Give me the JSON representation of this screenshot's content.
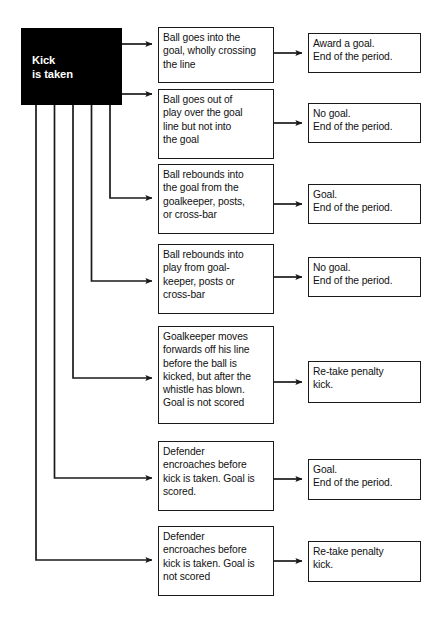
{
  "diagram": {
    "background_color": "#ffffff",
    "line_color": "#1a1a1a",
    "start_fill": "#000000",
    "start_text_color": "#ffffff"
  },
  "start_node": {
    "label": "Kick\nis taken",
    "x": 21,
    "y": 28,
    "w": 101,
    "h": 77
  },
  "conditions": [
    {
      "id": "c1",
      "label": "Ball goes into the\ngoal, wholly crossing\nthe line",
      "x": 158,
      "y": 27,
      "w": 116,
      "h": 56
    },
    {
      "id": "c2",
      "label": "Ball goes out of\nplay over the goal\nline but not into\nthe goal",
      "x": 158,
      "y": 89,
      "w": 116,
      "h": 70
    },
    {
      "id": "c3",
      "label": "Ball rebounds into\nthe goal from the\ngoalkeeper, posts,\nor cross-bar",
      "x": 158,
      "y": 164,
      "w": 116,
      "h": 70
    },
    {
      "id": "c4",
      "label": "Ball rebounds into\nplay from goal-\nkeeper, posts or\ncross-bar",
      "x": 158,
      "y": 244,
      "w": 116,
      "h": 70
    },
    {
      "id": "c5",
      "label": "Goalkeeper moves\nforwards off his line\nbefore the ball is\nkicked, but after the\nwhistle has blown.\nGoal is not scored",
      "x": 158,
      "y": 326,
      "w": 116,
      "h": 98
    },
    {
      "id": "c6",
      "label": "Defender\nencroaches before\nkick is taken. Goal is\nscored.",
      "x": 158,
      "y": 441,
      "w": 116,
      "h": 70
    },
    {
      "id": "c7",
      "label": "Defender\nencroaches before\nkick is taken. Goal is\nnot scored",
      "x": 158,
      "y": 526,
      "w": 116,
      "h": 70
    }
  ],
  "outcomes": [
    {
      "id": "o1",
      "label": "Award a goal.\nEnd of the period.",
      "x": 308,
      "y": 33,
      "w": 113,
      "h": 40
    },
    {
      "id": "o2",
      "label": "No goal.\nEnd of the period.",
      "x": 308,
      "y": 103,
      "w": 113,
      "h": 40
    },
    {
      "id": "o3",
      "label": "Goal.\nEnd of the period.",
      "x": 308,
      "y": 184,
      "w": 113,
      "h": 40
    },
    {
      "id": "o4",
      "label": "No goal.\nEnd of the period.",
      "x": 308,
      "y": 257,
      "w": 113,
      "h": 40
    },
    {
      "id": "o5",
      "label": "Re-take penalty\nkick.",
      "x": 308,
      "y": 361,
      "w": 113,
      "h": 42
    },
    {
      "id": "o6",
      "label": "Goal.\nEnd of the period.",
      "x": 308,
      "y": 459,
      "w": 113,
      "h": 41
    },
    {
      "id": "o7",
      "label": "Re-take penalty\nkick.",
      "x": 308,
      "y": 541,
      "w": 113,
      "h": 41
    }
  ],
  "edges": [
    {
      "from": "start",
      "to": "c1",
      "kind": "direct",
      "path": "M122,44 L152,44"
    },
    {
      "from": "start",
      "to": "c2",
      "kind": "direct",
      "path": "M122,94 L152,94"
    },
    {
      "from": "start",
      "to": "c3",
      "kind": "elbow",
      "path": "M110,105 L110,198 L152,198"
    },
    {
      "from": "start",
      "to": "c4",
      "kind": "elbow",
      "path": "M91.5,105 L91.5,281 L152,281"
    },
    {
      "from": "start",
      "to": "c5",
      "kind": "elbow",
      "path": "M73,105 L73,378 L152,378"
    },
    {
      "from": "start",
      "to": "c6",
      "kind": "elbow",
      "path": "M54.5,105 L54.5,478 L152,478"
    },
    {
      "from": "start",
      "to": "c7",
      "kind": "elbow",
      "path": "M36,105 L36,560 L152,560"
    },
    {
      "from": "c1",
      "to": "o1",
      "kind": "direct",
      "path": "M274,53 L302,53"
    },
    {
      "from": "c2",
      "to": "o2",
      "kind": "direct",
      "path": "M274,123 L302,123"
    },
    {
      "from": "c3",
      "to": "o3",
      "kind": "direct",
      "path": "M274,204 L302,204"
    },
    {
      "from": "c4",
      "to": "o4",
      "kind": "direct",
      "path": "M274,277 L302,277"
    },
    {
      "from": "c5",
      "to": "o5",
      "kind": "direct",
      "path": "M274,382 L302,382"
    },
    {
      "from": "c6",
      "to": "o6",
      "kind": "direct",
      "path": "M274,479 L302,479"
    },
    {
      "from": "c7",
      "to": "o7",
      "kind": "direct",
      "path": "M274,561 L302,561"
    }
  ]
}
